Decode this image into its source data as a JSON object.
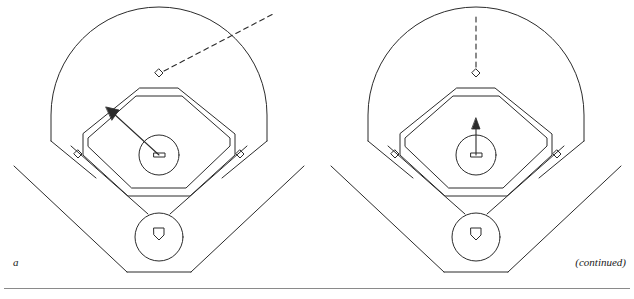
{
  "figure": {
    "type": "baseball-field-diagrams",
    "panels": [
      {
        "id": "a",
        "label": "a",
        "field": {
          "outfield_fence": "arc",
          "foul_lines": true,
          "infield_dirt": "octagon",
          "bases": [
            "first-base",
            "second-base",
            "third-base",
            "home-plate"
          ],
          "pitchers_mound": "circle-with-rubber"
        },
        "annotations": {
          "arrow": {
            "name": "fielder-movement-arrow",
            "from": "pitchers-mound",
            "to": "third-base-side",
            "direction": "up-left",
            "style": "solid-with-arrowhead"
          },
          "dashed_line": {
            "name": "ball-trajectory-line",
            "from": "second-base",
            "direction": "up-right",
            "style": "dashed"
          }
        }
      },
      {
        "id": "b",
        "label": "b",
        "field": {
          "outfield_fence": "arc",
          "foul_lines": true,
          "infield_dirt": "octagon",
          "bases": [
            "first-base",
            "second-base",
            "third-base",
            "home-plate"
          ],
          "pitchers_mound": "circle-with-rubber"
        },
        "annotations": {
          "arrow": {
            "name": "fielder-movement-arrow",
            "from": "pitchers-mound",
            "to": "second-base",
            "direction": "up",
            "style": "solid-with-arrowhead"
          },
          "dashed_line": {
            "name": "ball-trajectory-line",
            "from": "second-base",
            "direction": "up",
            "style": "dashed"
          }
        }
      }
    ],
    "continued_note": "(continued)",
    "colors": {
      "line": "#2b2b2b",
      "background": "#ffffff",
      "rule": "#8a8a8a",
      "text": "#1a1a1a"
    }
  }
}
